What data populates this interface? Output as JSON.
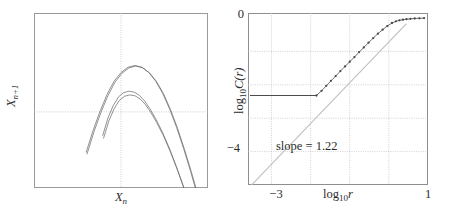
{
  "figure": {
    "panel_count": 2,
    "background": "#ffffff",
    "ink": "#2b2b2b"
  },
  "left_panel": {
    "name": "return-map",
    "xlabel_main": "X",
    "xlabel_sub": "n",
    "ylabel_main": "X",
    "ylabel_sub": "n+1",
    "crosshair_color": "#c9b9b9",
    "curve_color": "#6e6e6e",
    "frame_color": "#9a9a9a"
  },
  "right_panel": {
    "name": "correlation-dimension-plot",
    "xlabel_main": "log",
    "xlabel_sub": "10",
    "xlabel_var": "r",
    "ylabel_main": "log",
    "ylabel_sub": "10",
    "ylabel_var": "C(r)",
    "annotation": "slope = 1.22",
    "yticks": [
      {
        "label": "0",
        "value": 0
      },
      {
        "label": "−4",
        "value": -4
      }
    ],
    "xticks": [
      {
        "label": "−3",
        "value": -3
      },
      {
        "label": "1",
        "value": 1
      }
    ],
    "grid_color": "#bdbdbd",
    "fit_line_color": "#bfbfbf",
    "data_color": "#4a4a4a",
    "frame_color": "#8e8e8e"
  },
  "chart_data": [
    {
      "type": "line",
      "name": "return-map-attractor",
      "title": "",
      "xlabel": "X_n",
      "ylabel": "X_n+1",
      "xlim": [
        0,
        1
      ],
      "ylim": [
        0,
        1
      ],
      "grid": false,
      "crosshair": {
        "x": 0.5,
        "y": 0.435
      },
      "description": "Nested parabolic branches of a chaotic attractor return map",
      "series": [
        {
          "name": "outer-branch",
          "comment": "broad upper parabola spanning the attractor",
          "x": [
            0.3,
            0.34,
            0.38,
            0.42,
            0.46,
            0.5,
            0.54,
            0.58,
            0.62,
            0.66,
            0.7,
            0.74,
            0.78,
            0.82,
            0.86,
            0.9,
            0.94
          ],
          "y": [
            0.205,
            0.33,
            0.44,
            0.535,
            0.61,
            0.66,
            0.69,
            0.7,
            0.69,
            0.66,
            0.61,
            0.54,
            0.45,
            0.345,
            0.225,
            0.095,
            -0.045
          ]
        },
        {
          "name": "outer-branch-shadow",
          "comment": "nearly coincident second outer sheet, slightly offset",
          "x": [
            0.305,
            0.345,
            0.385,
            0.425,
            0.465,
            0.505,
            0.545,
            0.585,
            0.625,
            0.665,
            0.705,
            0.745,
            0.785,
            0.825,
            0.865,
            0.905,
            0.945
          ],
          "y": [
            0.195,
            0.322,
            0.433,
            0.528,
            0.604,
            0.655,
            0.686,
            0.697,
            0.687,
            0.657,
            0.607,
            0.537,
            0.447,
            0.341,
            0.22,
            0.09,
            -0.05
          ]
        },
        {
          "name": "inner-branch",
          "comment": "shorter inner parabola with flattened crest",
          "x": [
            0.395,
            0.425,
            0.455,
            0.485,
            0.515,
            0.545,
            0.575,
            0.605,
            0.635,
            0.665,
            0.7,
            0.74,
            0.78,
            0.82,
            0.86,
            0.895
          ],
          "y": [
            0.3,
            0.4,
            0.47,
            0.52,
            0.545,
            0.553,
            0.548,
            0.53,
            0.498,
            0.455,
            0.395,
            0.315,
            0.222,
            0.118,
            0.005,
            -0.095
          ]
        },
        {
          "name": "inner-branch-lower",
          "comment": "second inner sheet just below the first",
          "x": [
            0.4,
            0.43,
            0.46,
            0.49,
            0.52,
            0.55,
            0.58,
            0.61,
            0.64,
            0.67,
            0.705,
            0.745,
            0.785,
            0.825,
            0.865,
            0.9
          ],
          "y": [
            0.285,
            0.383,
            0.452,
            0.5,
            0.524,
            0.532,
            0.527,
            0.509,
            0.477,
            0.434,
            0.375,
            0.296,
            0.204,
            0.101,
            -0.01,
            -0.108
          ]
        }
      ]
    },
    {
      "type": "scatter",
      "name": "correlation-sum-scaling",
      "title": "",
      "xlabel": "log10 r",
      "ylabel": "log10 C(r)",
      "xlim": [
        -3.6,
        1.0
      ],
      "ylim": [
        -5.0,
        0.15
      ],
      "grid": true,
      "grid_x": [
        -3,
        -2,
        -1,
        0
      ],
      "grid_y": [
        -1,
        -2,
        -3,
        -4
      ],
      "slope": 1.22,
      "annotation": "slope = 1.22",
      "annotation_at": {
        "x": -2.55,
        "y": -3.5
      },
      "fit_line": {
        "name": "slope-1.22-reference-line",
        "x": [
          -3.55,
          0.45
        ],
        "y": [
          -5.05,
          -0.17
        ]
      },
      "saturation_line": {
        "name": "resolution-floor",
        "x": [
          -3.55,
          -1.85
        ],
        "y": [
          -2.32,
          -2.32
        ]
      },
      "points": {
        "x": [
          -1.85,
          -1.72,
          -1.6,
          -1.48,
          -1.36,
          -1.24,
          -1.12,
          -1.0,
          -0.88,
          -0.76,
          -0.64,
          -0.52,
          -0.4,
          -0.28,
          -0.16,
          -0.04,
          0.08,
          0.18,
          0.27,
          0.36,
          0.45,
          0.55,
          0.66,
          0.78,
          0.9
        ],
        "y": [
          -2.32,
          -2.18,
          -2.03,
          -1.88,
          -1.74,
          -1.59,
          -1.45,
          -1.31,
          -1.17,
          -1.02,
          -0.88,
          -0.74,
          -0.6,
          -0.47,
          -0.35,
          -0.24,
          -0.15,
          -0.1,
          -0.07,
          -0.05,
          -0.035,
          -0.025,
          -0.015,
          -0.008,
          -0.003
        ]
      }
    }
  ]
}
